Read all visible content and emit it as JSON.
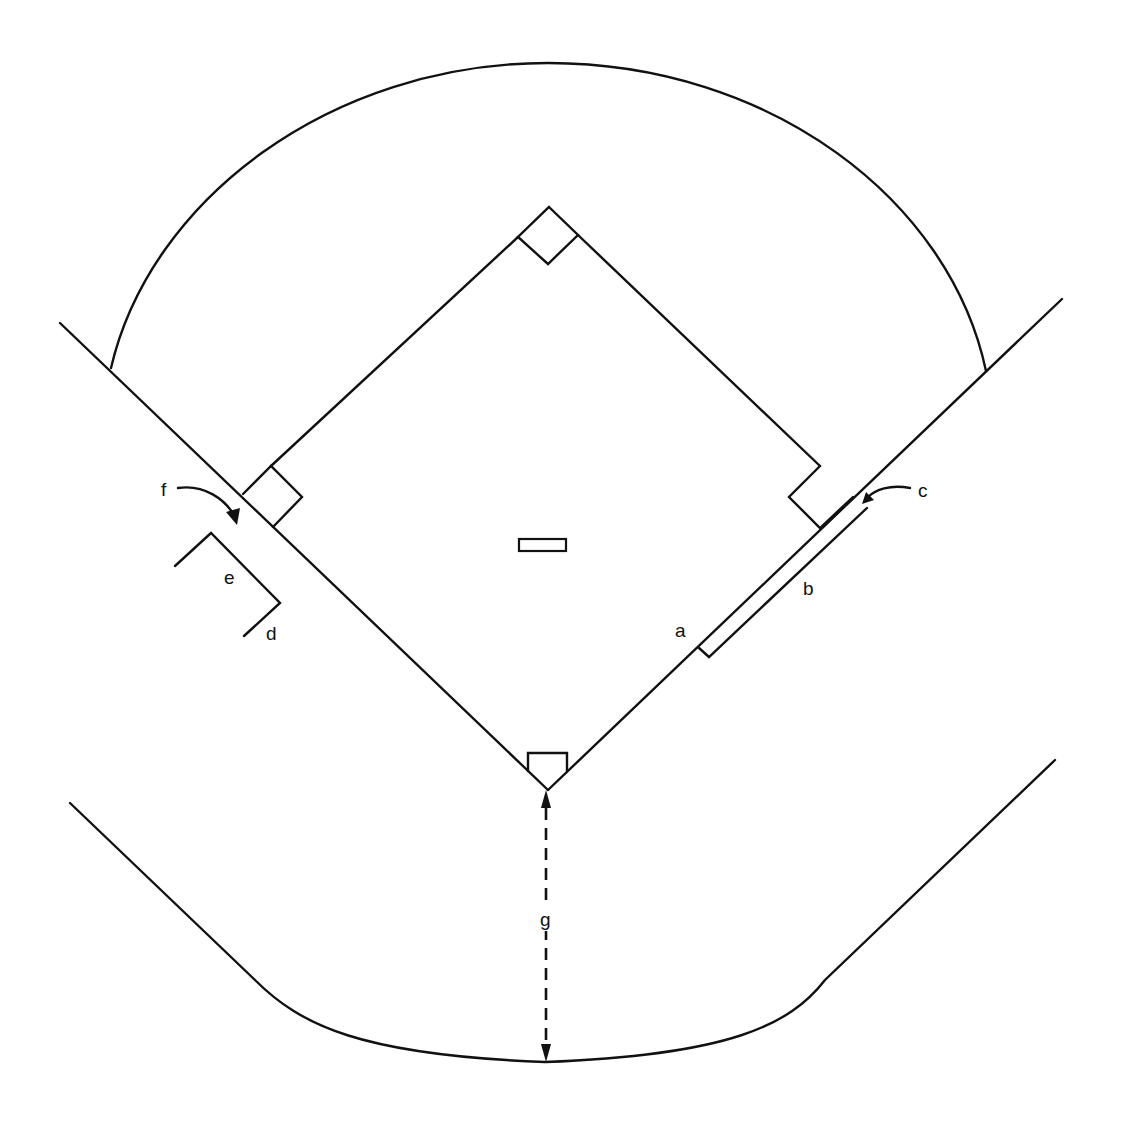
{
  "diagram": {
    "title": "",
    "stroke_color": "#111111",
    "background": "#ffffff",
    "elements": {
      "outfield_arc": "outfield-boundary",
      "foul_lines": [
        "left-foul-line",
        "right-foul-line"
      ],
      "bases": [
        "home-plate",
        "first-base",
        "second-base",
        "third-base"
      ],
      "pitchers_rubber": "pitchers-plate",
      "backstop": "backstop-fence"
    },
    "labels": {
      "a": "a",
      "b": "b",
      "c": "c",
      "d": "d",
      "e": "e",
      "f": "f",
      "g": "g"
    }
  }
}
